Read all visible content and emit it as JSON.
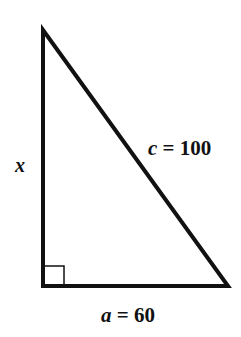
{
  "diagram": {
    "type": "right-triangle",
    "vertices": {
      "top": [
        43,
        30
      ],
      "right_angle": [
        43,
        286
      ],
      "bottom_right": [
        228,
        286
      ]
    },
    "labels": {
      "vertical_side": {
        "var": "x"
      },
      "hypotenuse": {
        "var": "c",
        "eq": " = ",
        "value": "100"
      },
      "base": {
        "var": "a",
        "eq": " = ",
        "value": "60"
      }
    },
    "right_angle_marker": true,
    "stroke_color": "#111111"
  }
}
